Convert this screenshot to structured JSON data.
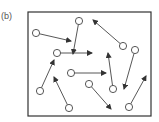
{
  "panel_label": "(b)",
  "colors": {
    "stroke": "#444444",
    "frame": "#333333",
    "circle_fill": "#ffffff"
  },
  "frame": {
    "x": 28,
    "y": 12,
    "width": 123,
    "height": 104
  },
  "particles": [
    {
      "cx": 36,
      "cy": 33,
      "tx": 71,
      "ty": 41
    },
    {
      "cx": 79,
      "cy": 21,
      "tx": 73,
      "ty": 54
    },
    {
      "cx": 57,
      "cy": 53,
      "tx": 92,
      "ty": 53
    },
    {
      "cx": 123,
      "cy": 46,
      "tx": 93,
      "ty": 20
    },
    {
      "cx": 135,
      "cy": 50,
      "tx": 124,
      "ty": 89
    },
    {
      "cx": 113,
      "cy": 89,
      "tx": 108,
      "ty": 53
    },
    {
      "cx": 71,
      "cy": 73,
      "tx": 106,
      "ty": 73
    },
    {
      "cx": 40,
      "cy": 91,
      "tx": 54,
      "ty": 60
    },
    {
      "cx": 69,
      "cy": 108,
      "tx": 54,
      "ty": 77
    },
    {
      "cx": 89,
      "cy": 84,
      "tx": 111,
      "ty": 109
    },
    {
      "cx": 129,
      "cy": 107,
      "tx": 146,
      "ty": 76
    }
  ]
}
